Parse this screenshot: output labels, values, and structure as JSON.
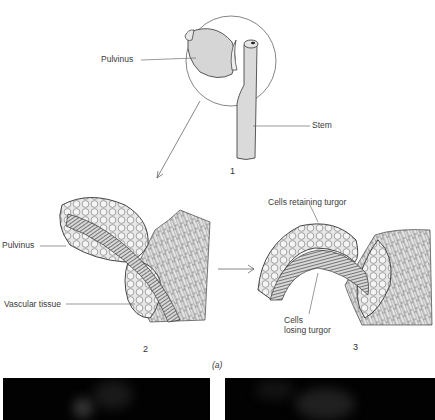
{
  "figure": {
    "part_label": "(a)",
    "panels": [
      {
        "number": "1",
        "labels": {
          "pulvinus": "Pulvinus",
          "stem": "Stem"
        }
      },
      {
        "number": "2",
        "labels": {
          "pulvinus": "Pulvinus",
          "vascular_tissue": "Vascular tissue"
        }
      },
      {
        "number": "3",
        "labels": {
          "cells_retaining_turgor": "Cells retaining turgor",
          "cells_losing_turgor_line1": "Cells",
          "cells_losing_turgor_line2": "losing turgor"
        }
      }
    ],
    "photos": [
      {
        "name": "photo-left"
      },
      {
        "name": "photo-right"
      }
    ]
  },
  "colors": {
    "line": "#4a4a4a",
    "fill_gray": "#dcdcdc",
    "photo_bg": "#020202"
  }
}
